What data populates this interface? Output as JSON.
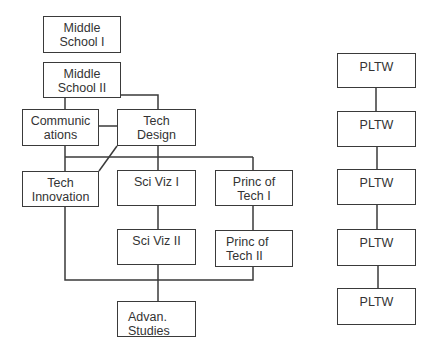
{
  "diagram": {
    "type": "course-pathway-flowchart",
    "left_pathway": {
      "nodes": [
        {
          "id": "ms1",
          "label": "Middle\nSchool I"
        },
        {
          "id": "ms2",
          "label": "Middle\nSchool II"
        },
        {
          "id": "comm",
          "label": "Communic\nations"
        },
        {
          "id": "techdesign",
          "label": "Tech\nDesign"
        },
        {
          "id": "techinnov",
          "label": "Tech\nInnovation"
        },
        {
          "id": "sciviz1",
          "label": "Sci Viz I"
        },
        {
          "id": "pot1",
          "label": "Princ of\nTech I"
        },
        {
          "id": "sciviz2",
          "label": "Sci Viz II"
        },
        {
          "id": "pot2",
          "label": "Princ of\nTech II"
        },
        {
          "id": "advan",
          "label": "Advan.\nStudies"
        }
      ],
      "edges": [
        [
          "ms2",
          "comm"
        ],
        [
          "ms2",
          "techdesign"
        ],
        [
          "comm",
          "techdesign"
        ],
        [
          "comm",
          "techinnov"
        ],
        [
          "comm",
          "sciviz1"
        ],
        [
          "comm",
          "pot1"
        ],
        [
          "techdesign",
          "techinnov"
        ],
        [
          "techdesign",
          "sciviz1"
        ],
        [
          "sciviz1",
          "sciviz2"
        ],
        [
          "pot1",
          "pot2"
        ],
        [
          "techinnov",
          "advan"
        ],
        [
          "sciviz2",
          "advan"
        ],
        [
          "pot2",
          "advan"
        ]
      ]
    },
    "right_pathway": {
      "nodes": [
        {
          "id": "pltw1",
          "label": "PLTW"
        },
        {
          "id": "pltw2",
          "label": "PLTW"
        },
        {
          "id": "pltw3",
          "label": "PLTW"
        },
        {
          "id": "pltw4",
          "label": "PLTW"
        },
        {
          "id": "pltw5",
          "label": "PLTW"
        }
      ],
      "edges": [
        [
          "pltw1",
          "pltw2"
        ],
        [
          "pltw2",
          "pltw3"
        ],
        [
          "pltw3",
          "pltw4"
        ],
        [
          "pltw4",
          "pltw5"
        ]
      ]
    },
    "colors": {
      "stroke": "#3a3a3a",
      "text": "#333333",
      "background": "#ffffff"
    }
  }
}
